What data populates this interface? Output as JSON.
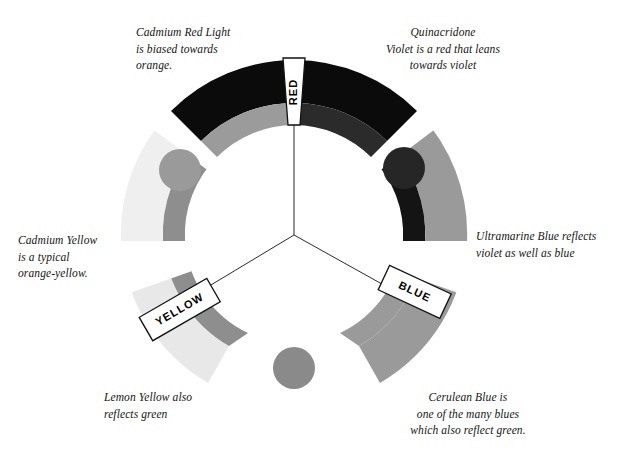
{
  "figure": {
    "background_color": "#ffffff",
    "width": 624,
    "height": 452
  },
  "primaries": [
    {
      "id": "red",
      "label": "RED",
      "label_rotation_deg": -90,
      "left_pigment": "Cadmium Red Light",
      "right_pigment": "Quinacridone Violet"
    },
    {
      "id": "yellow",
      "label": "YELLOW",
      "label_rotation_deg": -30,
      "left_pigment": "Lemon Yellow",
      "right_pigment": "Cadmium Yellow"
    },
    {
      "id": "blue",
      "label": "BLUE",
      "label_rotation_deg": 25,
      "left_pigment": "Ultramarine Blue",
      "right_pigment": "Cerulean Blue"
    }
  ],
  "annotations": {
    "cadmium_red": "Cadmium Red Light\nis biased towards\norange.",
    "quinacridone": "Quinacridone\nViolet is a red that leans\ntowards violet",
    "cadmium_yellow": "Cadmium Yellow\nis a typical\norange-yellow.",
    "ultramarine": "Ultramarine Blue reflects\nviolet as well as blue",
    "lemon_yellow": "Lemon Yellow also\nreflects green",
    "cerulean": "Cerulean Blue is\none of the many blues\nwhich also reflect green."
  },
  "colors": {
    "outer_red": "#0b0b0b",
    "inner_red_warm": "#9b9b9b",
    "inner_red_cool": "#2b2b2b",
    "outer_yellow_light": "#efefef",
    "outer_yellow_pale": "#e3e3e3",
    "inner_yellow": "#8e8e8e",
    "outer_blue": "#9a9a9a",
    "inner_blue_dark": "#141414",
    "dot_orange": "#9a9a9a",
    "dot_violet": "#262626",
    "dot_green": "#8a8a8a",
    "label_box_fill": "#ffffff",
    "label_box_stroke": "#111111",
    "spoke_stroke": "#2a2a2a",
    "text": "#141414"
  },
  "dots": [
    {
      "id": "orange-dot",
      "cx": 180,
      "cy": 170,
      "r": 21,
      "color": "#9a9a9a"
    },
    {
      "id": "violet-dot",
      "cx": 404,
      "cy": 168,
      "r": 21,
      "color": "#262626"
    },
    {
      "id": "green-dot",
      "cx": 294,
      "cy": 368,
      "r": 21,
      "color": "#8a8a8a"
    }
  ],
  "geometry": {
    "center_x": 294,
    "center_y": 235,
    "hub_x": 294,
    "hub_y": 235,
    "outer_radius": 175,
    "band_outer_width": 42,
    "band_inner_width": 22,
    "spoke_count": 3
  }
}
